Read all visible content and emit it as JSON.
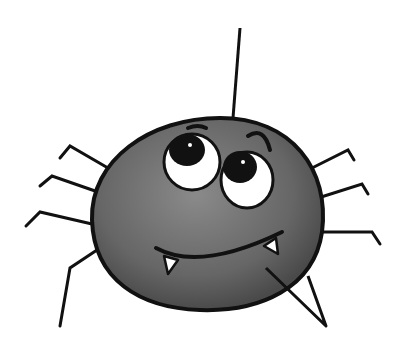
{
  "illustration": {
    "subject": "cartoon spider",
    "colors": {
      "background": "#ffffff",
      "body": "#6e6e6e",
      "body_dark": "#555555",
      "outline": "#111111",
      "eye_white": "#ffffff",
      "pupil": "#111111",
      "fang": "#ffffff"
    }
  }
}
